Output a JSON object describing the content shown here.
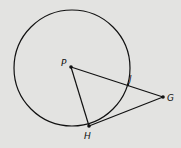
{
  "diagram": {
    "background": "#e3e3e1",
    "stroke_color": "#111111",
    "circle": {
      "name": "circle-P",
      "cx": 72,
      "cy": 68,
      "r": 58
    },
    "points": [
      {
        "id": "P",
        "label": "P",
        "x": 71,
        "y": 67,
        "label_x": 61,
        "label_y": 66
      },
      {
        "id": "J",
        "label": "J",
        "x": 128,
        "y": 85,
        "label_x": 129,
        "label_y": 82
      },
      {
        "id": "G",
        "label": "G",
        "x": 163,
        "y": 97,
        "label_x": 167,
        "label_y": 101
      },
      {
        "id": "H",
        "label": "H",
        "x": 89,
        "y": 126,
        "label_x": 84,
        "label_y": 139
      }
    ],
    "segments": [
      {
        "from": "P",
        "to": "G"
      },
      {
        "from": "P",
        "to": "H"
      },
      {
        "from": "H",
        "to": "G"
      }
    ]
  }
}
